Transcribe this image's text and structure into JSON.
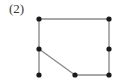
{
  "figure": {
    "label": "(2)",
    "label_position": {
      "x": 9,
      "y": 1
    },
    "canvas": {
      "width": 121,
      "height": 84
    },
    "background_color": "#ffffff",
    "edge_color": "#8c8c8c",
    "edge_width": 1.4,
    "vertex_color": "#1a1a1a",
    "vertex_radius": 2.6,
    "vertex_names": [
      "top-left",
      "top-right",
      "right-middle",
      "bottom-right",
      "bottom-middle",
      "left-middle",
      "bottom-left"
    ],
    "vertices": [
      {
        "name": "top-left",
        "x": 39,
        "y": 19
      },
      {
        "name": "top-right",
        "x": 109,
        "y": 19
      },
      {
        "name": "right-middle",
        "x": 109,
        "y": 49
      },
      {
        "name": "bottom-right",
        "x": 109,
        "y": 75
      },
      {
        "name": "bottom-middle",
        "x": 75,
        "y": 75
      },
      {
        "name": "left-middle",
        "x": 39,
        "y": 49
      },
      {
        "name": "bottom-left",
        "x": 39,
        "y": 75
      }
    ],
    "edges": [
      {
        "name": "top-edge",
        "x1": 39,
        "y1": 19,
        "x2": 109,
        "y2": 19
      },
      {
        "name": "right-edge",
        "x1": 109,
        "y1": 19,
        "x2": 109,
        "y2": 75
      },
      {
        "name": "bottom-edge",
        "x1": 109,
        "y1": 75,
        "x2": 75,
        "y2": 75
      },
      {
        "name": "diagonal-edge",
        "x1": 75,
        "y1": 75,
        "x2": 39,
        "y2": 49
      },
      {
        "name": "left-edge",
        "x1": 39,
        "y1": 19,
        "x2": 39,
        "y2": 75
      }
    ]
  }
}
